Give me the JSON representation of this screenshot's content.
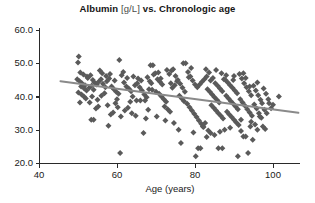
{
  "chart_data": {
    "type": "scatter",
    "title": "Albumin [g/L] vs. Chronologic age",
    "title_main": "Albumin",
    "title_unit": "[g/L]",
    "title_rest": "vs. Chronologic age",
    "xlabel": "Age (years)",
    "ylabel": "",
    "xlim": [
      40,
      107
    ],
    "ylim": [
      20.0,
      60.0
    ],
    "xticks": [
      40,
      60,
      80,
      100
    ],
    "xtick_labels": [
      "40",
      "60",
      "80",
      "100"
    ],
    "yticks": [
      20.0,
      30.0,
      40.0,
      50.0,
      60.0
    ],
    "ytick_labels": [
      "20.0",
      "30.0",
      "40.0",
      "50.0",
      "60.0"
    ],
    "grid": false,
    "legend": false,
    "marker": "diamond",
    "marker_color": "#5a5a5a",
    "marker_size": 3.0,
    "trendline": {
      "type": "linear-regression",
      "color": "#8a8a8a",
      "width": 2.0,
      "x_start": 45.5,
      "y_start": 44.6,
      "x_end": 106.5,
      "y_end": 35.1
    },
    "axis_color": "#2a2a2a",
    "points": [
      [
        50.2,
        52.0
      ],
      [
        50.0,
        50.2
      ],
      [
        50.6,
        47.2
      ],
      [
        51.4,
        46.6
      ],
      [
        52.3,
        46.0
      ],
      [
        49.8,
        45.2
      ],
      [
        50.4,
        44.6
      ],
      [
        51.0,
        44.0
      ],
      [
        51.8,
        43.4
      ],
      [
        52.5,
        45.6
      ],
      [
        53.2,
        46.4
      ],
      [
        53.8,
        45.0
      ],
      [
        50.8,
        43.0
      ],
      [
        51.6,
        42.4
      ],
      [
        52.2,
        41.8
      ],
      [
        52.9,
        42.6
      ],
      [
        53.5,
        43.2
      ],
      [
        54.2,
        44.2
      ],
      [
        50.1,
        41.2
      ],
      [
        50.9,
        40.6
      ],
      [
        51.5,
        40.0
      ],
      [
        52.0,
        39.4
      ],
      [
        50.5,
        38.2
      ],
      [
        53.0,
        38.2
      ],
      [
        54.0,
        42.0
      ],
      [
        54.8,
        43.6
      ],
      [
        55.3,
        44.4
      ],
      [
        55.9,
        45.2
      ],
      [
        56.4,
        43.8
      ],
      [
        57.0,
        42.8
      ],
      [
        53.4,
        33.0
      ],
      [
        54.0,
        33.0
      ],
      [
        54.6,
        36.4
      ],
      [
        55.2,
        37.0
      ],
      [
        56.0,
        40.2
      ],
      [
        56.8,
        41.0
      ],
      [
        57.4,
        44.6
      ],
      [
        58.0,
        45.4
      ],
      [
        58.6,
        43.0
      ],
      [
        59.2,
        42.2
      ],
      [
        59.8,
        41.4
      ],
      [
        60.4,
        40.8
      ],
      [
        57.8,
        31.2
      ],
      [
        58.4,
        34.6
      ],
      [
        59.0,
        35.2
      ],
      [
        59.6,
        38.0
      ],
      [
        60.0,
        39.2
      ],
      [
        60.8,
        23.0
      ],
      [
        60.6,
        51.0
      ],
      [
        61.2,
        46.4
      ],
      [
        61.8,
        44.2
      ],
      [
        62.4,
        43.0
      ],
      [
        63.0,
        42.4
      ],
      [
        63.6,
        41.6
      ],
      [
        61.0,
        34.0
      ],
      [
        62.0,
        35.8
      ],
      [
        62.8,
        36.6
      ],
      [
        63.4,
        38.4
      ],
      [
        64.0,
        40.0
      ],
      [
        64.6,
        43.4
      ],
      [
        65.2,
        44.0
      ],
      [
        65.8,
        42.8
      ],
      [
        66.4,
        41.8
      ],
      [
        67.0,
        40.6
      ],
      [
        67.6,
        39.8
      ],
      [
        68.2,
        42.2
      ],
      [
        65.0,
        38.8
      ],
      [
        66.0,
        38.8
      ],
      [
        67.2,
        38.8
      ],
      [
        66.8,
        29.0
      ],
      [
        68.0,
        36.0
      ],
      [
        68.8,
        44.0
      ],
      [
        68.6,
        49.4
      ],
      [
        69.2,
        49.4
      ],
      [
        69.8,
        47.0
      ],
      [
        70.4,
        45.2
      ],
      [
        71.0,
        44.4
      ],
      [
        71.6,
        43.6
      ],
      [
        69.0,
        42.0
      ],
      [
        70.0,
        41.4
      ],
      [
        70.8,
        40.8
      ],
      [
        71.4,
        40.0
      ],
      [
        72.0,
        39.2
      ],
      [
        72.6,
        38.4
      ],
      [
        72.2,
        37.0
      ],
      [
        73.0,
        36.2
      ],
      [
        73.6,
        35.4
      ],
      [
        74.2,
        42.6
      ],
      [
        74.8,
        43.4
      ],
      [
        75.4,
        44.6
      ],
      [
        74.0,
        47.8
      ],
      [
        75.0,
        46.2
      ],
      [
        75.6,
        45.0
      ],
      [
        76.2,
        43.8
      ],
      [
        76.8,
        42.6
      ],
      [
        77.4,
        41.4
      ],
      [
        77.0,
        50.0
      ],
      [
        77.6,
        50.0
      ],
      [
        78.2,
        47.4
      ],
      [
        78.8,
        46.0
      ],
      [
        79.4,
        44.8
      ],
      [
        80.0,
        43.6
      ],
      [
        76.0,
        40.2
      ],
      [
        76.6,
        39.4
      ],
      [
        77.2,
        38.6
      ],
      [
        78.0,
        37.8
      ],
      [
        78.6,
        36.8
      ],
      [
        79.2,
        35.8
      ],
      [
        79.8,
        34.8
      ],
      [
        80.4,
        33.8
      ],
      [
        81.0,
        32.8
      ],
      [
        81.6,
        31.8
      ],
      [
        82.2,
        30.8
      ],
      [
        75.8,
        30.0
      ],
      [
        76.4,
        26.0
      ],
      [
        80.2,
        22.0
      ],
      [
        80.8,
        24.4
      ],
      [
        81.4,
        24.4
      ],
      [
        82.0,
        31.0
      ],
      [
        82.6,
        32.0
      ],
      [
        80.6,
        42.8
      ],
      [
        81.2,
        43.6
      ],
      [
        81.8,
        44.4
      ],
      [
        82.4,
        45.2
      ],
      [
        83.0,
        46.0
      ],
      [
        83.6,
        47.2
      ],
      [
        83.2,
        42.2
      ],
      [
        83.8,
        41.4
      ],
      [
        84.4,
        40.6
      ],
      [
        85.0,
        39.8
      ],
      [
        85.6,
        39.0
      ],
      [
        86.2,
        38.2
      ],
      [
        84.0,
        44.8
      ],
      [
        84.6,
        45.6
      ],
      [
        85.2,
        44.0
      ],
      [
        85.8,
        43.2
      ],
      [
        86.4,
        42.4
      ],
      [
        87.0,
        41.6
      ],
      [
        84.2,
        37.4
      ],
      [
        84.8,
        36.6
      ],
      [
        85.4,
        35.8
      ],
      [
        86.0,
        35.0
      ],
      [
        86.6,
        34.2
      ],
      [
        87.2,
        33.4
      ],
      [
        83.4,
        29.8
      ],
      [
        84.0,
        29.0
      ],
      [
        85.0,
        28.4
      ],
      [
        86.0,
        24.4
      ],
      [
        87.0,
        24.4
      ],
      [
        87.6,
        30.0
      ],
      [
        87.8,
        45.0
      ],
      [
        88.4,
        44.2
      ],
      [
        89.0,
        43.4
      ],
      [
        89.6,
        42.6
      ],
      [
        90.2,
        41.8
      ],
      [
        90.8,
        41.0
      ],
      [
        88.0,
        40.2
      ],
      [
        88.6,
        39.4
      ],
      [
        89.2,
        38.6
      ],
      [
        89.8,
        37.8
      ],
      [
        90.4,
        37.0
      ],
      [
        91.0,
        36.2
      ],
      [
        88.2,
        35.4
      ],
      [
        88.8,
        34.6
      ],
      [
        89.4,
        33.8
      ],
      [
        90.0,
        33.0
      ],
      [
        90.6,
        32.2
      ],
      [
        91.2,
        31.4
      ],
      [
        91.4,
        46.8
      ],
      [
        92.0,
        45.4
      ],
      [
        92.6,
        44.0
      ],
      [
        93.2,
        42.8
      ],
      [
        93.8,
        41.6
      ],
      [
        94.4,
        40.4
      ],
      [
        91.6,
        39.2
      ],
      [
        92.2,
        38.2
      ],
      [
        92.8,
        37.2
      ],
      [
        93.4,
        36.2
      ],
      [
        94.0,
        35.2
      ],
      [
        94.6,
        34.2
      ],
      [
        91.8,
        29.6
      ],
      [
        92.4,
        28.0
      ],
      [
        93.0,
        28.0
      ],
      [
        91.0,
        22.0
      ],
      [
        93.6,
        23.0
      ],
      [
        94.2,
        31.0
      ],
      [
        95.0,
        43.2
      ],
      [
        95.6,
        41.8
      ],
      [
        96.2,
        40.4
      ],
      [
        96.8,
        39.0
      ],
      [
        95.2,
        37.6
      ],
      [
        95.8,
        36.4
      ],
      [
        96.4,
        35.0
      ],
      [
        97.0,
        33.6
      ],
      [
        95.4,
        31.6
      ],
      [
        96.0,
        30.0
      ],
      [
        94.8,
        27.0
      ],
      [
        96.6,
        34.0
      ],
      [
        97.6,
        42.4
      ],
      [
        98.2,
        40.8
      ],
      [
        98.8,
        39.2
      ],
      [
        97.2,
        38.0
      ],
      [
        97.8,
        36.0
      ],
      [
        98.4,
        35.0
      ],
      [
        101.5,
        40.0
      ],
      [
        99.0,
        38.0
      ],
      [
        99.5,
        36.5
      ],
      [
        100.0,
        37.5
      ],
      [
        72.8,
        48.0
      ],
      [
        74.4,
        48.2
      ],
      [
        55.6,
        47.8
      ],
      [
        56.2,
        47.0
      ],
      [
        57.2,
        46.2
      ],
      [
        58.2,
        46.8
      ],
      [
        61.6,
        47.4
      ],
      [
        64.2,
        46.0
      ],
      [
        66.2,
        44.8
      ],
      [
        67.8,
        45.8
      ],
      [
        69.4,
        46.6
      ],
      [
        70.6,
        47.2
      ],
      [
        73.4,
        46.8
      ],
      [
        82.8,
        48.2
      ],
      [
        86.8,
        47.0
      ],
      [
        88.0,
        46.4
      ],
      [
        90.0,
        46.2
      ],
      [
        92.4,
        47.0
      ],
      [
        85.4,
        48.0
      ],
      [
        79.0,
        48.6
      ],
      [
        59.4,
        44.8
      ],
      [
        62.6,
        45.6
      ],
      [
        65.4,
        45.4
      ],
      [
        68.4,
        44.6
      ],
      [
        71.2,
        45.4
      ],
      [
        73.8,
        44.0
      ],
      [
        78.4,
        45.8
      ],
      [
        87.4,
        45.2
      ],
      [
        89.8,
        45.0
      ],
      [
        93.0,
        45.6
      ],
      [
        96.0,
        44.2
      ],
      [
        94.0,
        43.0
      ],
      [
        53.6,
        40.0
      ],
      [
        55.0,
        39.0
      ],
      [
        57.6,
        37.4
      ],
      [
        60.2,
        36.8
      ],
      [
        63.8,
        35.0
      ],
      [
        64.8,
        34.2
      ],
      [
        67.4,
        33.4
      ],
      [
        70.2,
        34.0
      ],
      [
        72.4,
        32.8
      ],
      [
        74.6,
        32.0
      ],
      [
        79.6,
        29.2
      ],
      [
        83.0,
        27.8
      ],
      [
        86.4,
        29.4
      ],
      [
        89.0,
        30.6
      ],
      [
        91.8,
        33.0
      ],
      [
        94.4,
        32.4
      ],
      [
        97.4,
        31.0
      ],
      [
        98.0,
        30.2
      ]
    ]
  }
}
